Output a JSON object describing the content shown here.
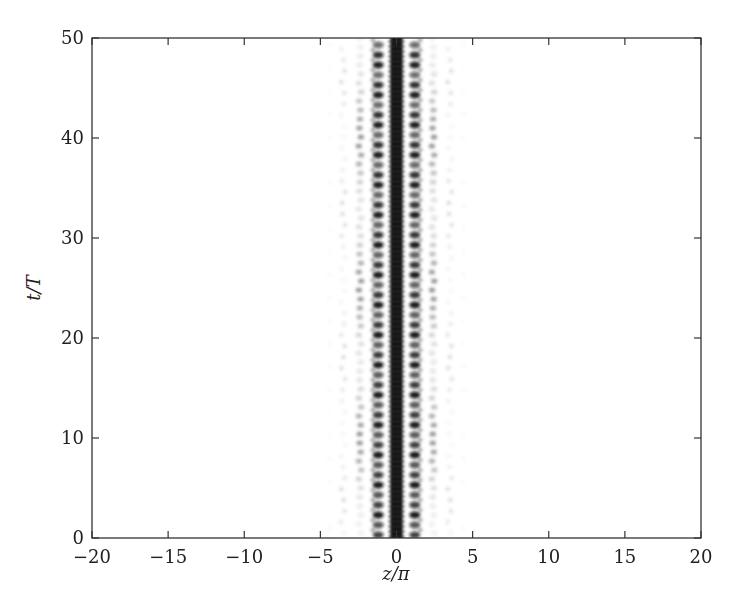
{
  "chart_data": {
    "type": "heatmap",
    "title": "",
    "xlabel": "z/π",
    "ylabel": "t/T",
    "xlim": [
      -20,
      20
    ],
    "ylim": [
      0,
      50
    ],
    "xticks": [
      -20,
      -15,
      -10,
      -5,
      0,
      5,
      10,
      15,
      20
    ],
    "xtick_labels": [
      "−20",
      "−15",
      "−10",
      "−5",
      "0",
      "5",
      "10",
      "15",
      "20"
    ],
    "yticks": [
      0,
      10,
      20,
      30,
      40,
      50
    ],
    "ytick_labels": [
      "0",
      "10",
      "20",
      "30",
      "40",
      "50"
    ],
    "grid": false,
    "legend": null,
    "colormap": "grayscale (white=0, black=max)",
    "features": [
      {
        "name": "central-column",
        "z_center": 0.0,
        "z_halfwidth": 0.4,
        "intensity": 1.0,
        "pattern": "continuous"
      },
      {
        "name": "first-side-lobes",
        "z_center": [
          -1.2,
          1.2
        ],
        "z_halfwidth": 0.3,
        "intensity": 0.85,
        "pattern": "periodic blobs",
        "t_period": 1.0
      },
      {
        "name": "second-side-lobes",
        "z_center": [
          -2.4,
          2.4
        ],
        "z_halfwidth": 0.3,
        "intensity": 0.3,
        "pattern": "periodic, modulated in t (stronger near t≈5-15, 20-30, 35-45)"
      },
      {
        "name": "outer-faint-lobes",
        "z_center": [
          -3.5,
          3.5
        ],
        "z_halfwidth": 0.3,
        "intensity": 0.1,
        "pattern": "sparse faint streaks"
      }
    ]
  },
  "colors": {
    "frame": "#333333",
    "ink": "#111111",
    "background": "#ffffff"
  }
}
